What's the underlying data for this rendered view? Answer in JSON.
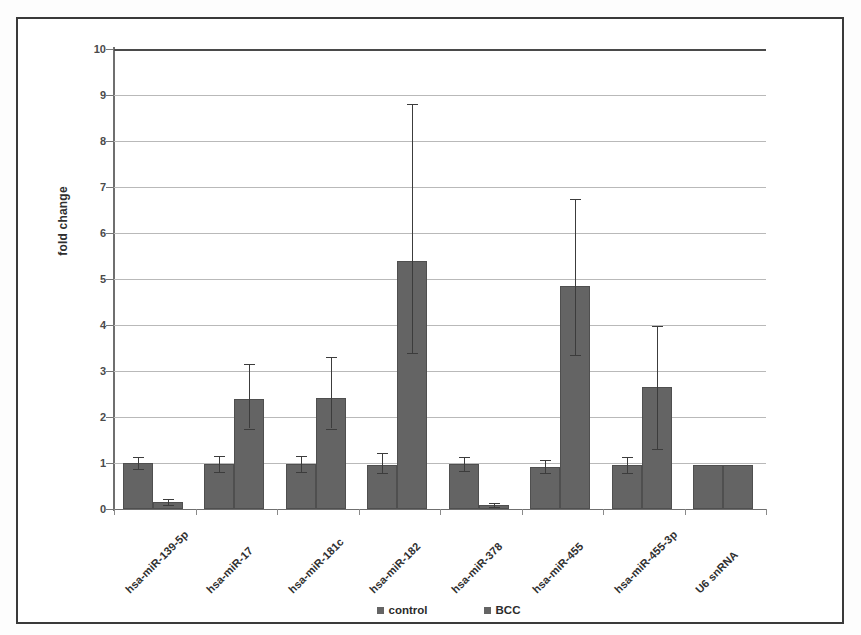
{
  "chart_data": {
    "type": "bar",
    "title": "",
    "xlabel": "",
    "ylabel": "fold change",
    "ylim": [
      0,
      10
    ],
    "ytick_labels": [
      "10",
      "9",
      "8",
      "7",
      "6",
      "5",
      "4",
      "3",
      "2",
      "1",
      "0"
    ],
    "ytick_values": [
      10,
      9,
      8,
      7,
      6,
      5,
      4,
      3,
      2,
      1,
      0
    ],
    "grid": true,
    "legend_position": "bottom",
    "categories": [
      "hsa-miR-139-5p",
      "hsa-miR-17",
      "hsa-miR-181c",
      "hsa-miR-182",
      "hsa-miR-378",
      "hsa-miR-455",
      "hsa-miR-455-3p",
      "U6 snRNA"
    ],
    "series": [
      {
        "name": "control",
        "color": "#646464",
        "values": [
          1.0,
          0.97,
          0.97,
          0.95,
          0.97,
          0.92,
          0.95,
          0.95
        ],
        "err_low": [
          0.86,
          0.8,
          0.8,
          0.78,
          0.82,
          0.78,
          0.78,
          null
        ],
        "err_high": [
          1.14,
          1.16,
          1.16,
          1.22,
          1.12,
          1.06,
          1.12,
          null
        ]
      },
      {
        "name": "BCC",
        "color": "#646464",
        "values": [
          0.15,
          2.4,
          2.42,
          5.4,
          0.08,
          4.85,
          2.65,
          0.95
        ],
        "err_low": [
          0.08,
          1.75,
          1.75,
          3.4,
          0.04,
          3.35,
          1.3,
          null
        ],
        "err_high": [
          0.22,
          3.15,
          3.3,
          8.8,
          0.14,
          6.75,
          3.98,
          null
        ]
      }
    ]
  },
  "legend": {
    "items": [
      {
        "label": "control",
        "color": "#646464"
      },
      {
        "label": "BCC",
        "color": "#646464"
      }
    ]
  }
}
